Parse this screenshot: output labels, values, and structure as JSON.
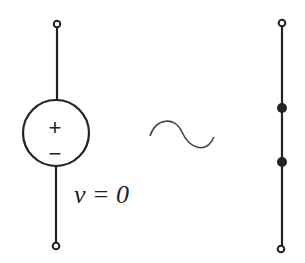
{
  "diagram": {
    "voltage_source": {
      "plus_sign": "+",
      "minus_sign": "−",
      "label": "v = 0"
    },
    "equivalence_symbol": "tilde",
    "short_circuit": {
      "nodes": 2
    },
    "colors": {
      "stroke": "#222222",
      "background": "#ffffff"
    }
  }
}
